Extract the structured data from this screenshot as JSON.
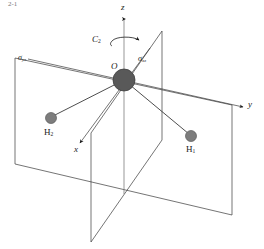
{
  "figure": {
    "kind": "molecular-symmetry-diagram",
    "molecule": "H2O",
    "background_color": "#ffffff",
    "line_color": "#3a3a3a",
    "atoms": [
      {
        "id": "O",
        "label": "O",
        "label_html": "O",
        "x": 124,
        "y": 80,
        "r": 11,
        "color": "#595959",
        "edge": "#3f3f3f"
      },
      {
        "id": "H1",
        "label": "H1",
        "label_html": "H<sub>1</sub>",
        "x": 191,
        "y": 136,
        "r": 5.5,
        "color": "#7d7d7d",
        "edge": "#5a5a5a"
      },
      {
        "id": "H2",
        "label": "H2",
        "label_html": "H<sub>2</sub>",
        "x": 51,
        "y": 118,
        "r": 5.5,
        "color": "#7d7d7d",
        "edge": "#5a5a5a"
      }
    ],
    "axes": [
      {
        "name": "z",
        "label": "z",
        "label_x": 123,
        "label_y": 6
      },
      {
        "name": "y",
        "label": "y",
        "label_x": 249,
        "label_y": 103
      },
      {
        "name": "x",
        "label": "x",
        "label_x": 75,
        "label_y": 148
      }
    ],
    "planes": [
      {
        "name": "sigma-yz",
        "label": "σ",
        "subscript": "yz",
        "label_x": 17,
        "label_y": 58
      },
      {
        "name": "sigma-xz",
        "label": "σ",
        "subscript": "xz",
        "label_x": 139,
        "label_y": 58
      }
    ],
    "operations": [
      {
        "name": "C2-axis",
        "label": "C",
        "subscript": "2",
        "label_x": 94,
        "label_y": 40
      }
    ],
    "corner_number": "2-1"
  }
}
